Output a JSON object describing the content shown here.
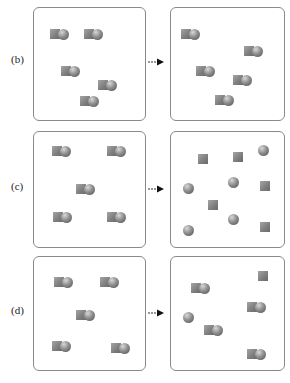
{
  "rows": [
    {
      "label": "(b)",
      "before": {
        "molecules": [
          [
            50,
            29
          ],
          [
            84,
            29
          ],
          [
            61,
            66
          ],
          [
            98,
            80
          ],
          [
            80,
            96
          ]
        ],
        "atoms_sq": [],
        "atoms_ball": []
      },
      "after": {
        "molecules": [
          [
            181,
            29
          ],
          [
            244,
            46
          ],
          [
            196,
            66
          ],
          [
            233,
            75
          ],
          [
            215,
            95
          ]
        ],
        "atoms_sq": [],
        "atoms_ball": []
      }
    },
    {
      "label": "(c)",
      "before": {
        "molecules": [
          [
            52,
            146
          ],
          [
            107,
            146
          ],
          [
            76,
            184
          ],
          [
            53,
            212
          ],
          [
            107,
            212
          ]
        ],
        "atoms_sq": [],
        "atoms_ball": []
      },
      "after": {
        "molecules": [],
        "atoms_sq": [
          [
            198,
            154
          ],
          [
            233,
            152
          ],
          [
            260,
            181
          ],
          [
            208,
            200
          ],
          [
            260,
            222
          ]
        ],
        "atoms_ball": [
          [
            258,
            145
          ],
          [
            183,
            183
          ],
          [
            228,
            177
          ],
          [
            183,
            225
          ],
          [
            228,
            214
          ]
        ]
      }
    },
    {
      "label": "(d)",
      "before": {
        "molecules": [
          [
            54,
            277
          ],
          [
            100,
            277
          ],
          [
            76,
            310
          ],
          [
            52,
            341
          ],
          [
            111,
            343
          ]
        ],
        "atoms_sq": [],
        "atoms_ball": []
      },
      "after": {
        "molecules": [
          [
            191,
            283
          ],
          [
            247,
            302
          ],
          [
            204,
            325
          ],
          [
            247,
            349
          ]
        ],
        "atoms_sq": [
          [
            258,
            271
          ]
        ],
        "atoms_ball": [
          [
            183,
            312
          ]
        ]
      }
    }
  ],
  "arrow_glyph": "right-arrow",
  "colors": {
    "border": "#8a8a8a",
    "shape": "#808080"
  }
}
